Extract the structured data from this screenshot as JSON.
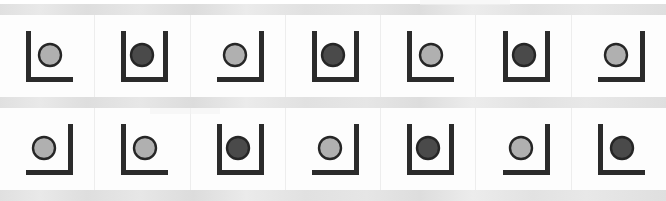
{
  "image": {
    "title": "Containers with balls - two rows of seven cells",
    "width": 666,
    "height": 201,
    "background_color": "#fdfdfd",
    "separator_band_color": "#e3e3e3",
    "grid_line_color": "#ededed",
    "stroke_color": "#2b2b2b",
    "ball_light_fill": "#b0b0b0",
    "ball_dark_fill": "#4a4a4a",
    "ball_outline": "#262626"
  },
  "legend": {
    "container_types": [
      "L",
      "U",
      "J"
    ],
    "ball_shades": [
      "light",
      "dark"
    ],
    "L_description": "left wall and bottom",
    "U_description": "left wall, right wall and bottom",
    "J_description": "right wall and bottom"
  },
  "rows": [
    {
      "name": "top-row",
      "index": 1,
      "cells": [
        {
          "index": 1,
          "container": "L",
          "ball": "light",
          "ball_fill": "#b0b0b0",
          "ball_side": "right"
        },
        {
          "index": 2,
          "container": "U",
          "ball": "dark",
          "ball_fill": "#4a4a4a",
          "ball_side": "center"
        },
        {
          "index": 3,
          "container": "J",
          "ball": "light",
          "ball_fill": "#b0b0b0",
          "ball_side": "left"
        },
        {
          "index": 4,
          "container": "U",
          "ball": "dark",
          "ball_fill": "#4a4a4a",
          "ball_side": "center"
        },
        {
          "index": 5,
          "container": "L",
          "ball": "light",
          "ball_fill": "#b0b0b0",
          "ball_side": "right"
        },
        {
          "index": 6,
          "container": "U",
          "ball": "dark",
          "ball_fill": "#4a4a4a",
          "ball_side": "center"
        },
        {
          "index": 7,
          "container": "J",
          "ball": "light",
          "ball_fill": "#b0b0b0",
          "ball_side": "left"
        }
      ]
    },
    {
      "name": "bottom-row",
      "index": 2,
      "cells": [
        {
          "index": 1,
          "container": "J",
          "ball": "light",
          "ball_fill": "#b0b0b0",
          "ball_side": "left"
        },
        {
          "index": 2,
          "container": "L",
          "ball": "light",
          "ball_fill": "#b0b0b0",
          "ball_side": "right"
        },
        {
          "index": 3,
          "container": "U",
          "ball": "dark",
          "ball_fill": "#4a4a4a",
          "ball_side": "center"
        },
        {
          "index": 4,
          "container": "J",
          "ball": "light",
          "ball_fill": "#b0b0b0",
          "ball_side": "left"
        },
        {
          "index": 5,
          "container": "U",
          "ball": "dark",
          "ball_fill": "#4a4a4a",
          "ball_side": "center"
        },
        {
          "index": 6,
          "container": "J",
          "ball": "light",
          "ball_fill": "#b0b0b0",
          "ball_side": "left"
        },
        {
          "index": 7,
          "container": "L",
          "ball": "dark",
          "ball_fill": "#4a4a4a",
          "ball_side": "right"
        }
      ]
    }
  ]
}
